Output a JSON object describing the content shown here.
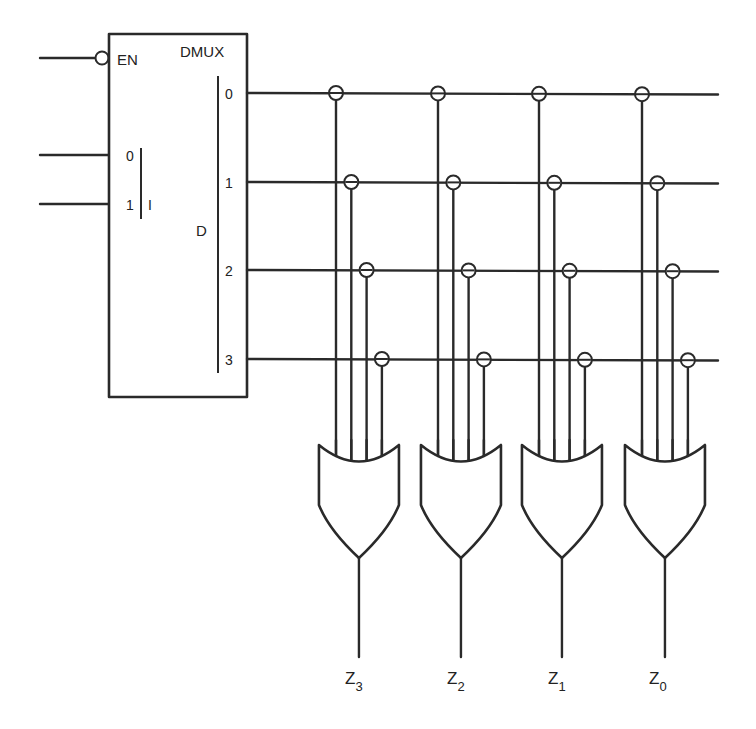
{
  "diagram": {
    "type": "logic-circuit",
    "demux": {
      "title": "DMUX",
      "enable_label": "EN",
      "enable_active_low": true,
      "select_inputs": [
        "0",
        "1"
      ],
      "select_group_label": "I",
      "data_label": "D",
      "outputs": [
        "0",
        "1",
        "2",
        "3"
      ]
    },
    "gates": [
      {
        "type": "OR",
        "inputs": 4,
        "output_label": "Z",
        "output_index": "3"
      },
      {
        "type": "OR",
        "inputs": 4,
        "output_label": "Z",
        "output_index": "2"
      },
      {
        "type": "OR",
        "inputs": 4,
        "output_label": "Z",
        "output_index": "1"
      },
      {
        "type": "OR",
        "inputs": 4,
        "output_label": "Z",
        "output_index": "0"
      }
    ],
    "connections_note": "Each DMUX output line connects (circle marker) to input k of every OR gate",
    "colors": {
      "ink": "#2a2a2a",
      "background": "#ffffff"
    }
  }
}
